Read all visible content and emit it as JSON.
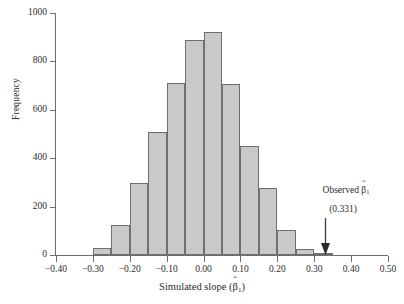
{
  "chart_data": {
    "type": "bar",
    "title": "",
    "subtitle": "",
    "xlabel": "Simulated slope (β̂1)",
    "ylabel": "Frequency",
    "xlim": [
      -0.4,
      0.5
    ],
    "ylim": [
      0,
      1000
    ],
    "grid": false,
    "legend": null,
    "bin_width": 0.05,
    "xticks": [
      "-0.40",
      "-0.30",
      "-0.20",
      "-0.10",
      "0.00",
      "0.10",
      "0.20",
      "0.30",
      "0.40",
      "0.50"
    ],
    "xtick_values": [
      -0.4,
      -0.3,
      -0.2,
      -0.1,
      0.0,
      0.1,
      0.2,
      0.3,
      0.4,
      0.5
    ],
    "yticks": [
      "0",
      "200",
      "400",
      "600",
      "800",
      "1000"
    ],
    "ytick_values": [
      0,
      200,
      400,
      600,
      800,
      1000
    ],
    "bin_starts": [
      -0.3,
      -0.25,
      -0.2,
      -0.15,
      -0.1,
      -0.05,
      0.0,
      0.05,
      0.1,
      0.15,
      0.2,
      0.25,
      0.3
    ],
    "bin_ends": [
      -0.25,
      -0.2,
      -0.15,
      -0.1,
      -0.05,
      0.0,
      0.05,
      0.1,
      0.15,
      0.2,
      0.25,
      0.3,
      0.35
    ],
    "categories": [
      "-0.30 to -0.25",
      "-0.25 to -0.20",
      "-0.20 to -0.15",
      "-0.15 to -0.10",
      "-0.10 to -0.05",
      "-0.05 to 0.00",
      "0.00 to 0.05",
      "0.05 to 0.10",
      "0.10 to 0.15",
      "0.15 to 0.20",
      "0.20 to 0.25",
      "0.25 to 0.30",
      "0.30 to 0.35"
    ],
    "values": [
      30,
      125,
      298,
      508,
      710,
      890,
      920,
      708,
      450,
      278,
      105,
      25,
      8
    ],
    "annotations": [
      {
        "label": "Observed β̂1",
        "value_label": "(0.331)",
        "x": 0.331,
        "arrow": "down"
      }
    ]
  },
  "axis": {
    "ylabel": "Frequency",
    "xlabel_prefix": "Simulated slope (",
    "xlabel_beta": "β",
    "xlabel_hat": "ˆ",
    "xlabel_sub": "1",
    "xlabel_suffix": ")"
  },
  "annotation": {
    "label_prefix": "Observed ",
    "label_beta": "β",
    "label_hat": "ˆ",
    "label_sub": "1",
    "value": "(0.331)"
  },
  "colors": {
    "bar_fill": "#c9c9c9",
    "bar_border": "#6f6f6f",
    "axis": "#6d6d6d",
    "text": "#2b2b2b",
    "background": "#ffffff"
  }
}
